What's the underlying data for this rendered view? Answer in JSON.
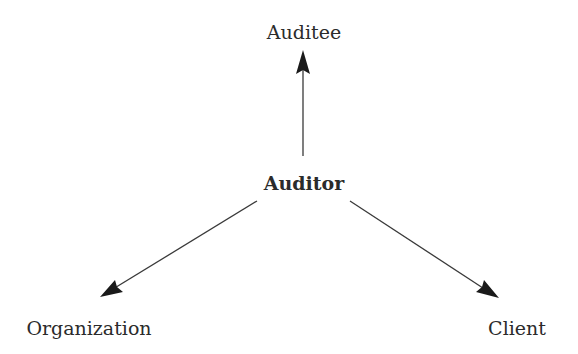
{
  "diagram": {
    "center": {
      "label": "Auditor"
    },
    "nodes": [
      {
        "id": "auditee",
        "label": "Auditee"
      },
      {
        "id": "organization",
        "label": "Organization"
      },
      {
        "id": "client",
        "label": "Client"
      }
    ],
    "edges": [
      {
        "from": "Auditor",
        "to": "Auditee"
      },
      {
        "from": "Auditor",
        "to": "Organization"
      },
      {
        "from": "Auditor",
        "to": "Client"
      }
    ],
    "colors": {
      "stroke": "#2b2b2b",
      "background": "#ffffff"
    }
  }
}
